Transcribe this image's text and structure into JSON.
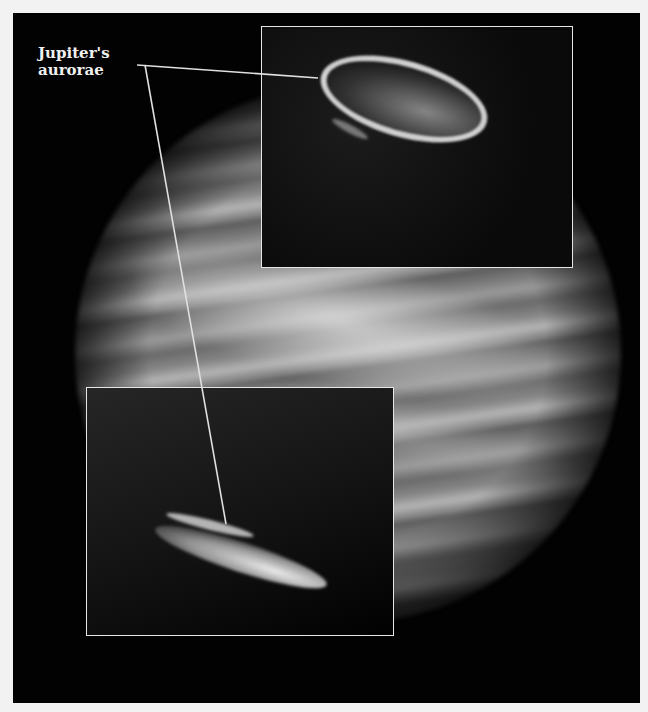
{
  "figure": {
    "subject": "Jupiter",
    "label_line1": "Jupiter's",
    "label_line2": "aurorae",
    "insets": [
      {
        "position": "top-right",
        "content": "northern auroral oval (bright ring)"
      },
      {
        "position": "bottom-left",
        "content": "southern auroral oval (elongated bright arcs)"
      }
    ],
    "colors": {
      "background": "#020202",
      "inset_border": "#e6e6e6",
      "leader_line": "#e0e0e0",
      "label_text": "#f0f0f0",
      "page": "#f2f2f2"
    }
  }
}
